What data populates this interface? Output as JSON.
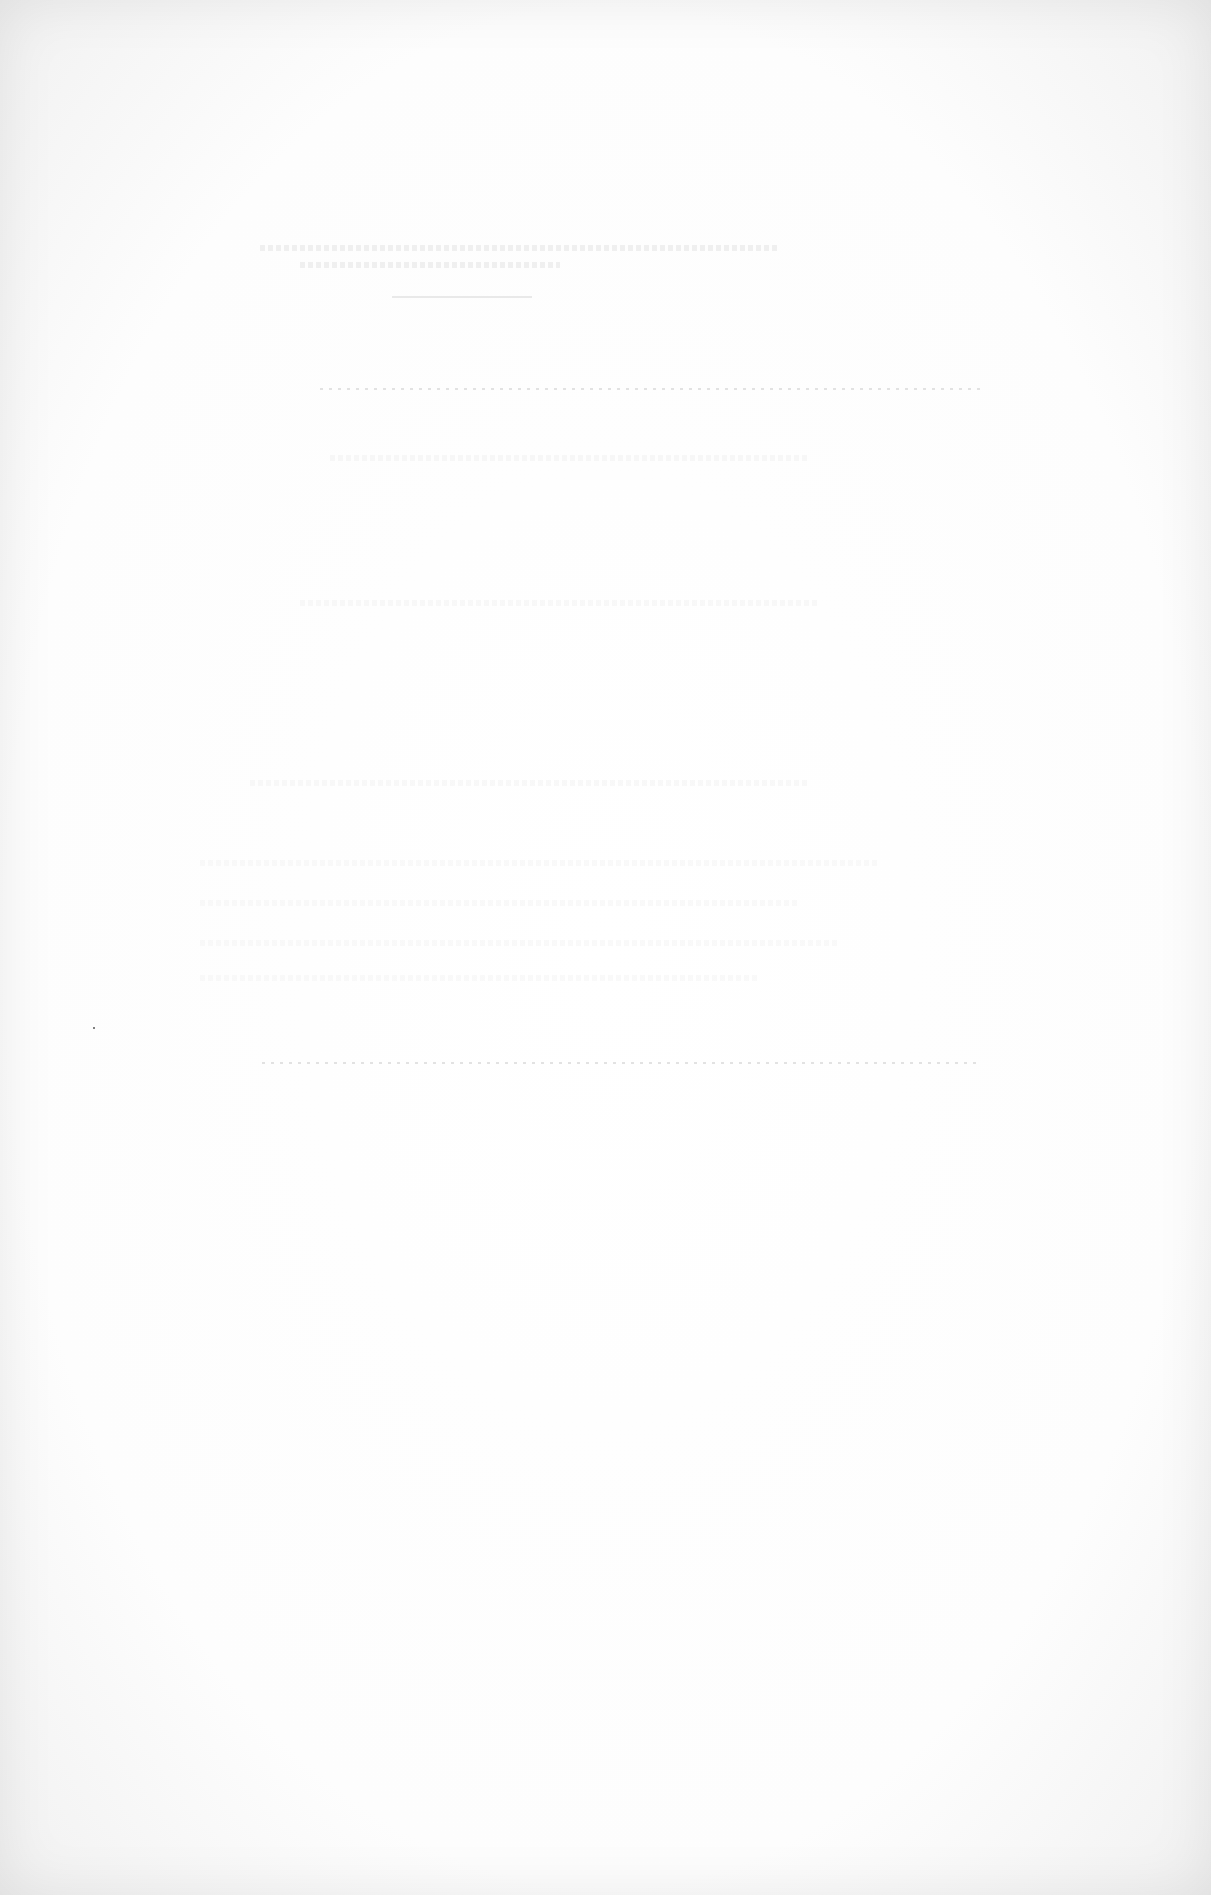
{
  "document": {
    "type": "scanned-page",
    "content": "blank page with faint bleed-through marks; no legible text",
    "background_color": "#fdfdfd",
    "mark_color": "#d6d6d6"
  }
}
